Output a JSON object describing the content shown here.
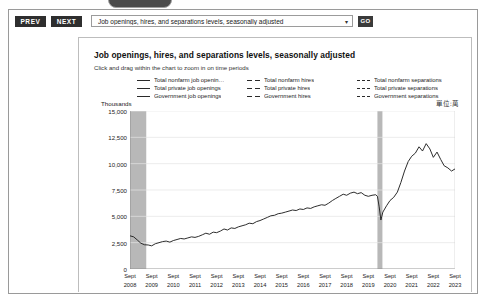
{
  "toolbar": {
    "prev_label": "PREV",
    "next_label": "NEXT",
    "go_label": "GO",
    "series_select_value": "Job openings, hires, and separations levels, seasonally adjusted",
    "chevron": "▾"
  },
  "chart_card": {
    "title": "Job openings, hires, and separations levels, seasonally adjusted",
    "subtitle": "Click and drag within the chart to zoom in on time periods",
    "units_note": "單位:萬",
    "y_axis_label": "Thousands"
  },
  "legend": {
    "columns": [
      {
        "items": [
          {
            "label": "Total nonfarm job openin…",
            "style": "solid"
          },
          {
            "label": "Total private job openings",
            "style": "solid"
          },
          {
            "label": "Government job openings",
            "style": "solid"
          }
        ]
      },
      {
        "items": [
          {
            "label": "Total nonfarm hires",
            "style": "dash"
          },
          {
            "label": "Total private hires",
            "style": "dash"
          },
          {
            "label": "Government hires",
            "style": "dash"
          }
        ]
      },
      {
        "items": [
          {
            "label": "Total nonfarm separations",
            "style": "dot"
          },
          {
            "label": "Total private separations",
            "style": "dot"
          },
          {
            "label": "Government separations",
            "style": "dot"
          }
        ]
      }
    ]
  },
  "chart_data": {
    "type": "line",
    "title": "Job openings, hires, and separations levels, seasonally adjusted",
    "subtitle": "Click and drag within the chart to zoom in on time periods",
    "xlabel": "",
    "ylabel": "Thousands",
    "ylim": [
      0,
      15000
    ],
    "yticks": [
      0,
      2500,
      5000,
      7500,
      10000,
      12500,
      15000
    ],
    "ytick_labels": [
      "0",
      "2,500",
      "5,000",
      "7,500",
      "10,000",
      "12,500",
      "15,000"
    ],
    "grid": true,
    "legend_position": "top",
    "x_tick_labels": [
      "Sept 2008",
      "Sept 2009",
      "Sept 2010",
      "Sept 2011",
      "Sept 2012",
      "Sept 2013",
      "Sept 2014",
      "Sept 2015",
      "Sept 2016",
      "Sept 2017",
      "Sept 2018",
      "Sept 2019",
      "Sept 2020",
      "Sept 2021",
      "Sept 2022",
      "Sept 2023"
    ],
    "x_tick_years": [
      2008,
      2009,
      2010,
      2011,
      2012,
      2013,
      2014,
      2015,
      2016,
      2017,
      2018,
      2019,
      2020,
      2021,
      2022,
      2023
    ],
    "xlim": [
      2008.7,
      2023.7
    ],
    "recession_bands": [
      {
        "start": 2008.7,
        "end": 2009.45
      },
      {
        "start": 2020.12,
        "end": 2020.35
      }
    ],
    "series": [
      {
        "name": "Total nonfarm job openings",
        "style": "solid",
        "color": "#222222",
        "x": [
          2008.7,
          2008.87,
          2009.04,
          2009.2,
          2009.37,
          2009.54,
          2009.7,
          2009.87,
          2010.04,
          2010.2,
          2010.37,
          2010.54,
          2010.7,
          2010.87,
          2011.04,
          2011.2,
          2011.37,
          2011.54,
          2011.7,
          2011.87,
          2012.04,
          2012.2,
          2012.37,
          2012.54,
          2012.7,
          2012.87,
          2013.04,
          2013.2,
          2013.37,
          2013.54,
          2013.7,
          2013.87,
          2014.04,
          2014.2,
          2014.37,
          2014.54,
          2014.7,
          2014.87,
          2015.04,
          2015.2,
          2015.37,
          2015.54,
          2015.7,
          2015.87,
          2016.04,
          2016.2,
          2016.37,
          2016.54,
          2016.7,
          2016.87,
          2017.04,
          2017.2,
          2017.37,
          2017.54,
          2017.7,
          2017.87,
          2018.04,
          2018.2,
          2018.37,
          2018.54,
          2018.7,
          2018.87,
          2019.04,
          2019.2,
          2019.37,
          2019.54,
          2019.7,
          2019.87,
          2020.04,
          2020.12,
          2020.2,
          2020.28,
          2020.37,
          2020.54,
          2020.7,
          2020.87,
          2021.04,
          2021.2,
          2021.37,
          2021.54,
          2021.7,
          2021.87,
          2022.04,
          2022.2,
          2022.37,
          2022.54,
          2022.7,
          2022.87,
          2023.04,
          2023.2,
          2023.37,
          2023.54,
          2023.7
        ],
        "y": [
          3150,
          3050,
          2750,
          2450,
          2300,
          2280,
          2200,
          2400,
          2500,
          2600,
          2650,
          2550,
          2700,
          2800,
          2900,
          2850,
          2950,
          3050,
          3000,
          3100,
          3250,
          3400,
          3300,
          3500,
          3450,
          3600,
          3800,
          3700,
          3900,
          3850,
          4000,
          4100,
          4200,
          4350,
          4300,
          4500,
          4600,
          4750,
          4900,
          5050,
          5100,
          5250,
          5300,
          5400,
          5500,
          5600,
          5550,
          5700,
          5650,
          5800,
          5750,
          5900,
          6000,
          6100,
          6050,
          6250,
          6500,
          6700,
          6900,
          7100,
          7000,
          7200,
          7300,
          7150,
          7250,
          7000,
          6900,
          7000,
          7050,
          6900,
          5900,
          4650,
          5400,
          6000,
          6500,
          6800,
          7300,
          8200,
          9300,
          10200,
          10700,
          11000,
          11600,
          11200,
          11900,
          11400,
          10600,
          11100,
          10400,
          9800,
          9600,
          9300,
          9500
        ]
      }
    ],
    "note": "Only the Total nonfarm job openings series is visibly plotted in this view; remaining legend series are not drawn within the displayed range."
  }
}
